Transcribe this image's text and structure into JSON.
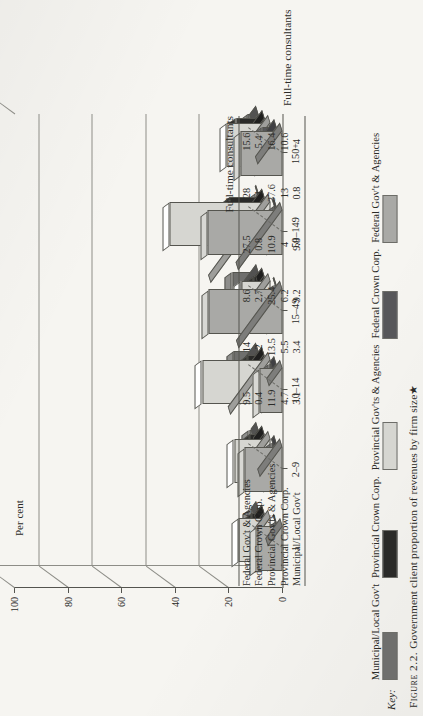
{
  "figure": {
    "number": "Figure 2.2.",
    "caption": "Government client proportion of revenues by firm size★"
  },
  "key": {
    "title": "Key:",
    "items": [
      {
        "label": "Municipal/Local Gov't",
        "color": "#6f6f6d"
      },
      {
        "label": "Provincial Crown Corp.",
        "color": "#2a2a28"
      },
      {
        "label": "Provincial Gov'ts & Agencies",
        "color": "#d6d6d1"
      },
      {
        "label": "Federal Crown Corp.",
        "color": "#57575a"
      },
      {
        "label": "Federal Gov't & Agencies",
        "color": "#a9a9a6"
      }
    ]
  },
  "chart_data": {
    "type": "bar",
    "title": "Government client proportion of revenues by firm size",
    "xlabel": "Full-time consultants",
    "ylabel": "Per cent",
    "ylim": [
      0,
      100
    ],
    "yticks": [
      "0",
      "20",
      "40",
      "60",
      "80",
      "100"
    ],
    "grid": true,
    "legend_position": "bottom",
    "categories": [
      "1",
      "2–9",
      "10–14",
      "15–49",
      "50–149",
      "150+"
    ],
    "series": [
      {
        "name": "Federal Gov't & Agencies",
        "values": [
          9.5,
          14,
          8.6,
          27.5,
          28,
          15.6
        ]
      },
      {
        "name": "Federal Crown Corp.",
        "values": [
          0.4,
          2,
          2.7,
          0.8,
          1,
          5.4
        ]
      },
      {
        "name": "Provincial Gov'ts & Agencies",
        "values": [
          11.9,
          13.5,
          25.4,
          10.9,
          37.6,
          16.4
        ]
      },
      {
        "name": "Provincial Crown Corp.",
        "values": [
          4.7,
          5.5,
          6.2,
          4,
          13,
          10.6
        ]
      },
      {
        "name": "Municipal/Local Gov't",
        "values": [
          3.1,
          3.4,
          9.2,
          9.8,
          0.8,
          4
        ]
      }
    ]
  },
  "table": {
    "header": "Full-time consultants",
    "columns": [
      "1",
      "2–9",
      "10–14",
      "15–49",
      "50–149",
      "150+"
    ],
    "rows": [
      {
        "label": "Federal Gov't & Agencies",
        "values": [
          "9.5",
          "14",
          "8.6",
          "27.5",
          "28",
          "15.6"
        ]
      },
      {
        "label": "Federal Crown Corp.",
        "values": [
          "0.4",
          "2",
          "2.7",
          "0.8",
          "1",
          "5.4"
        ]
      },
      {
        "label": "Provincial Gov'ts & Agencies",
        "values": [
          "11.9",
          "13.5",
          "25.4",
          "10.9",
          "37.6",
          "16.4"
        ]
      },
      {
        "label": "Provincial Crown Corp.",
        "values": [
          "4.7",
          "5.5",
          "6.2",
          "4",
          "13",
          "10.6"
        ]
      },
      {
        "label": "Municipal/Local Gov't",
        "values": [
          "3.1",
          "3.4",
          "9.2",
          "9.8",
          "0.8",
          "4"
        ]
      }
    ]
  }
}
